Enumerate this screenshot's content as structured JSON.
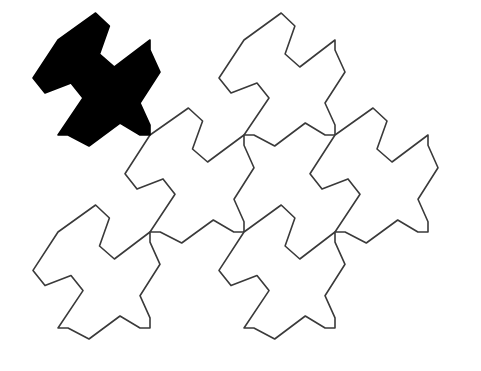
{
  "figure": {
    "background_color": "#ffffff",
    "stroke_color": "#3a3a3a",
    "highlight_color": "#000000",
    "grid": {
      "columns_x": [
        58,
        150,
        244,
        335,
        428
      ],
      "rows_y": [
        40,
        135,
        232,
        328
      ]
    },
    "edge_templates": {
      "top_diagonal": [
        [
          0,
          0
        ],
        [
          38,
          -27
        ],
        [
          52,
          -14
        ],
        [
          42,
          14
        ],
        [
          57,
          27
        ],
        [
          93,
          0
        ]
      ],
      "right_vertical": [
        [
          0,
          0
        ],
        [
          0,
          10
        ],
        [
          10,
          32
        ],
        [
          -10,
          63
        ],
        [
          0,
          85
        ],
        [
          0,
          95
        ]
      ],
      "bottom_horizontal": [
        [
          0,
          0
        ],
        [
          10,
          0
        ],
        [
          31,
          11
        ],
        [
          62,
          -12
        ],
        [
          82,
          0
        ],
        [
          92,
          0
        ]
      ],
      "left_diagonal": [
        [
          0,
          0
        ],
        [
          -25,
          38
        ],
        [
          -13,
          53
        ],
        [
          13,
          43
        ],
        [
          25,
          58
        ],
        [
          0,
          95
        ]
      ]
    },
    "tiles": [
      {
        "col": 0,
        "row": 0,
        "highlighted": true
      },
      {
        "col": 2,
        "row": 0,
        "highlighted": false
      },
      {
        "col": 1,
        "row": 1,
        "highlighted": false
      },
      {
        "col": 3,
        "row": 1,
        "highlighted": false
      },
      {
        "col": 0,
        "row": 2,
        "highlighted": false
      },
      {
        "col": 2,
        "row": 2,
        "highlighted": false
      }
    ]
  }
}
